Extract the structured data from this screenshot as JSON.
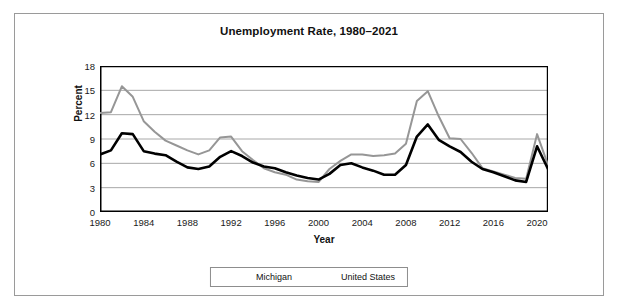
{
  "chart_data": {
    "type": "line",
    "title": "Unemployment Rate, 1980–2021",
    "xlabel": "Year",
    "ylabel": "Percent",
    "xlim": [
      1980,
      2021
    ],
    "ylim": [
      0,
      18
    ],
    "ytick_labels": [
      "0",
      "3",
      "6",
      "9",
      "12",
      "15",
      "18"
    ],
    "yticks": [
      0,
      3,
      6,
      9,
      12,
      15,
      18
    ],
    "xtick_labels": [
      "1980",
      "1984",
      "1988",
      "1992",
      "1996",
      "2000",
      "2004",
      "2008",
      "2012",
      "2016",
      "2020"
    ],
    "xticks": [
      1980,
      1984,
      1988,
      1992,
      1996,
      2000,
      2004,
      2008,
      2012,
      2016,
      2020
    ],
    "minor_xticks_interval": 1,
    "grid": "horizontal",
    "legend_position": "bottom-center",
    "x": [
      1980,
      1981,
      1982,
      1983,
      1984,
      1985,
      1986,
      1987,
      1988,
      1989,
      1990,
      1991,
      1992,
      1993,
      1994,
      1995,
      1996,
      1997,
      1998,
      1999,
      2000,
      2001,
      2002,
      2003,
      2004,
      2005,
      2006,
      2007,
      2008,
      2009,
      2010,
      2011,
      2012,
      2013,
      2014,
      2015,
      2016,
      2017,
      2018,
      2019,
      2020,
      2021
    ],
    "series": [
      {
        "name": "Michigan",
        "color": "#969696",
        "line_width": 2,
        "values": [
          12.2,
          12.3,
          15.5,
          14.2,
          11.2,
          9.9,
          8.8,
          8.2,
          7.6,
          7.1,
          7.6,
          9.2,
          9.3,
          7.5,
          6.4,
          5.4,
          4.9,
          4.6,
          4.0,
          3.8,
          3.7,
          5.3,
          6.3,
          7.1,
          7.1,
          6.9,
          7.0,
          7.2,
          8.4,
          13.7,
          14.9,
          11.8,
          9.1,
          9.0,
          7.3,
          5.4,
          5.0,
          4.6,
          4.2,
          4.1,
          9.6,
          5.8
        ]
      },
      {
        "name": "United States",
        "color": "#000000",
        "line_width": 2.6,
        "values": [
          7.1,
          7.6,
          9.7,
          9.6,
          7.5,
          7.2,
          7.0,
          6.2,
          5.5,
          5.3,
          5.6,
          6.8,
          7.5,
          6.9,
          6.1,
          5.6,
          5.4,
          4.9,
          4.5,
          4.2,
          4.0,
          4.7,
          5.8,
          6.0,
          5.5,
          5.1,
          4.6,
          4.6,
          5.8,
          9.3,
          10.8,
          8.9,
          8.1,
          7.4,
          6.2,
          5.3,
          4.9,
          4.4,
          3.9,
          3.7,
          8.1,
          5.3
        ]
      }
    ]
  },
  "legend": {
    "entries": [
      {
        "label": "Michigan"
      },
      {
        "label": "United States"
      }
    ]
  }
}
